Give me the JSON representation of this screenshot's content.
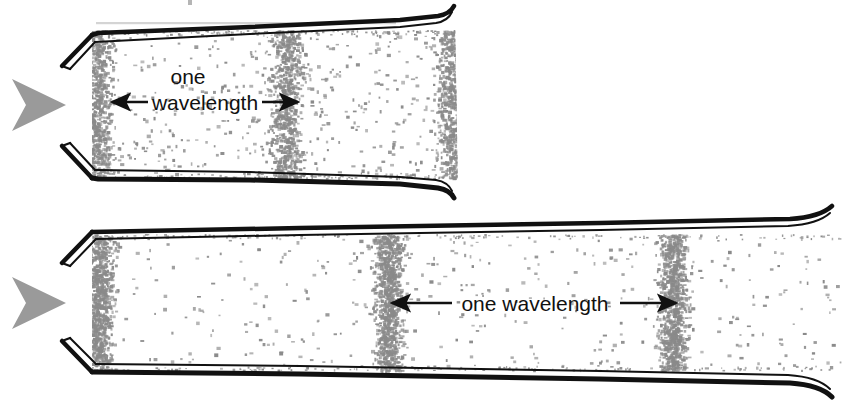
{
  "figure": {
    "background_color": "#ffffff",
    "ink_color": "#111111",
    "particle_color": "#8a8a8a",
    "source_arrow_color": "#9a9a9a"
  },
  "top_panel": {
    "name": "short-tube-high-frequency",
    "source_arrow_label": "sound-source-arrow",
    "label_line_1": "one",
    "label_line_2": "wavelength",
    "left_arrow_glyph": "←",
    "right_arrow_glyph": "→"
  },
  "bottom_panel": {
    "name": "long-tube-low-frequency",
    "source_arrow_label": "sound-source-arrow",
    "label": "one wavelength",
    "left_arrow_glyph": "←",
    "right_arrow_glyph": "→"
  },
  "chart_data": {
    "type": "scatter",
    "xlabel": "",
    "ylabel": "",
    "panels": [
      {
        "name": "top-tube",
        "tube_x_range": [
          92,
          455
        ],
        "tube_y_range": [
          28,
          180
        ],
        "compression_centers_x": [
          96,
          286,
          452
        ],
        "wavelength_px": 190,
        "wavelength_arrow_from_x": 112,
        "wavelength_arrow_to_x": 296,
        "wavelength_arrow_y": 100,
        "particle_count": 2600,
        "band_sigma": 34,
        "baseline_density": 0.18
      },
      {
        "name": "bottom-tube",
        "tube_x_range": [
          92,
          840
        ],
        "tube_y_range": [
          232,
          372
        ],
        "compression_centers_x": [
          98,
          388,
          672
        ],
        "wavelength_px": 284,
        "wavelength_arrow_from_x": 390,
        "wavelength_arrow_to_x": 672,
        "wavelength_arrow_y": 303,
        "particle_count": 3000,
        "band_sigma": 30,
        "baseline_density": 0.13
      }
    ],
    "legend": [],
    "grid": false
  }
}
